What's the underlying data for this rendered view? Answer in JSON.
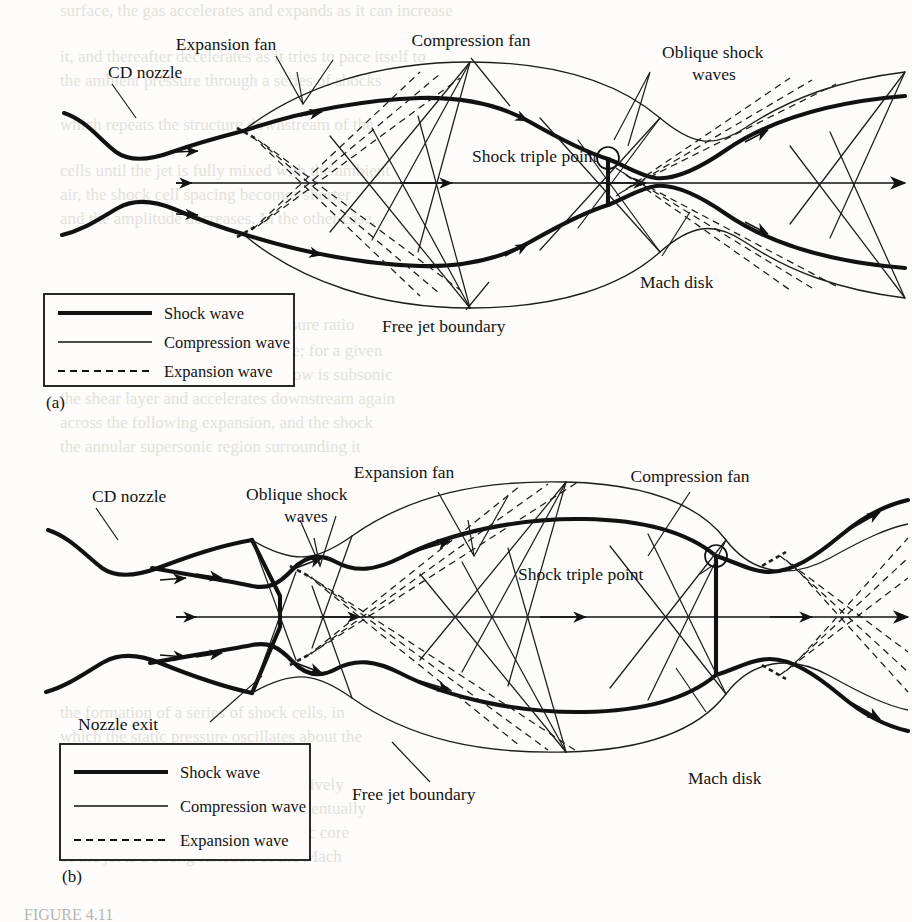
{
  "figure": {
    "caption": "FIGURE 4.11",
    "panels": [
      {
        "id": "(a)",
        "name": "underexpanded-jet",
        "labels": {
          "cd_nozzle": "CD nozzle",
          "expansion_fan": "Expansion fan",
          "compression_fan": "Compression fan",
          "oblique_shock_waves_line1": "Oblique shock",
          "oblique_shock_waves_line2": "waves",
          "shock_triple_point": "Shock triple point",
          "mach_disk": "Mach disk",
          "free_jet_boundary": "Free jet boundary"
        }
      },
      {
        "id": "(b)",
        "name": "overexpanded-jet",
        "labels": {
          "cd_nozzle": "CD nozzle",
          "oblique_shock_waves_line1": "Oblique shock",
          "oblique_shock_waves_line2": "waves",
          "expansion_fan": "Expansion fan",
          "compression_fan": "Compression fan",
          "shock_triple_point": "Shock triple point",
          "nozzle_exit": "Nozzle exit",
          "mach_disk": "Mach disk",
          "free_jet_boundary": "Free jet boundary"
        }
      }
    ],
    "legend": {
      "items": [
        {
          "label": "Shock wave",
          "style": "thick-solid"
        },
        {
          "label": "Compression wave",
          "style": "thin-solid"
        },
        {
          "label": "Expansion wave",
          "style": "dashed"
        }
      ]
    },
    "colors": {
      "ink": "#111111",
      "paper": "#fdfcfa",
      "faded": "#5d5d5d"
    }
  }
}
